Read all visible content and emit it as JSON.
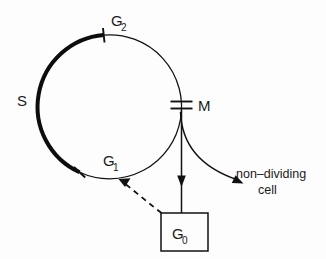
{
  "diagram": {
    "type": "cell-cycle",
    "colors": {
      "ink": "#111111",
      "background": "#fdfdfd",
      "s_phase_arc": "#0d0d0d"
    },
    "circle": {
      "center_x": 110,
      "center_y": 107,
      "radius": 72
    },
    "labels": {
      "s_phase": "S",
      "s_phase_sub": "",
      "g2_phase": "G",
      "g2_phase_sub": "2",
      "g1_phase": "G",
      "g1_phase_sub": "1",
      "m_phase": "M",
      "g0_phase": "G",
      "g0_phase_sub": "0",
      "non_dividing_line1": "non–dividing",
      "non_dividing_line2": "cell"
    },
    "phases": [
      {
        "name": "S",
        "label": "S",
        "arc_style": "thick",
        "start_deg": 245,
        "end_deg": 95
      },
      {
        "name": "G2",
        "label": "G₂",
        "marker": "single-tick",
        "angle_deg": 95
      },
      {
        "name": "M",
        "label": "M",
        "marker": "double-tick",
        "angle_deg": 0
      },
      {
        "name": "G1",
        "label": "G₁",
        "marker": "single-tick",
        "angle_deg": 245
      },
      {
        "name": "G0",
        "label": "G₀",
        "marker": "box"
      }
    ],
    "connections": [
      {
        "from": "M",
        "to": "G0",
        "style": "solid-arrow",
        "direction": "down"
      },
      {
        "from": "G0",
        "to": "G1",
        "style": "dashed-arrow",
        "direction": "up-left"
      },
      {
        "from": "M",
        "to": "non-dividing cell",
        "style": "curved-arrow",
        "direction": "down-right"
      }
    ],
    "g0_box": {
      "x": 161,
      "y": 213,
      "width": 47,
      "height": 38
    }
  }
}
